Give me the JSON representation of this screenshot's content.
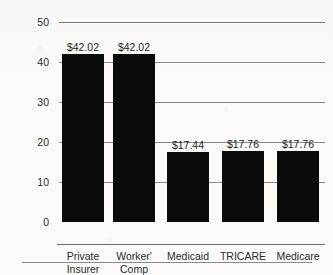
{
  "chart_data": {
    "type": "bar",
    "title": "",
    "title_note": "title cropped off at top edge of screenshot",
    "xlabel": "",
    "ylabel": "Dollars",
    "ylim": [
      0,
      50
    ],
    "yticks": [
      "0",
      "10",
      "20",
      "30",
      "40",
      "50"
    ],
    "grid": true,
    "legend": "none",
    "categories": [
      "Private Insurer",
      "Worker' Comp",
      "Medicaid",
      "TRICARE",
      "Medicare"
    ],
    "category_lines": [
      [
        "Private",
        "Insurer"
      ],
      [
        "Worker'",
        "Comp"
      ],
      [
        "Medicaid",
        ""
      ],
      [
        "TRICARE",
        ""
      ],
      [
        "Medicare",
        ""
      ]
    ],
    "values": [
      42.02,
      42.02,
      17.44,
      17.76,
      17.76
    ],
    "data_labels": [
      "$42.02",
      "$42.02",
      "$17.44",
      "$17.76",
      "$17.76"
    ],
    "bar_color": "#0a0a0a",
    "background_color": "#fbfaf8",
    "gridline_color": "#8b8b8b"
  },
  "page": {
    "footer_rule": true
  }
}
